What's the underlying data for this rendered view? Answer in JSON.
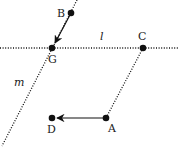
{
  "diagram": {
    "colors": {
      "ink": "#111111",
      "dots": "#111111",
      "background": "#ffffff"
    },
    "points": [
      {
        "id": "B",
        "label": "B",
        "x": 71,
        "y": 13,
        "lx": 57,
        "ly": 17
      },
      {
        "id": "G",
        "label": "G",
        "x": 52,
        "y": 48,
        "lx": 48,
        "ly": 63
      },
      {
        "id": "C",
        "label": "C",
        "x": 143,
        "y": 48,
        "lx": 138,
        "ly": 40
      },
      {
        "id": "D",
        "label": "D",
        "x": 52,
        "y": 118,
        "lx": 47,
        "ly": 133
      },
      {
        "id": "A",
        "label": "A",
        "x": 106,
        "y": 118,
        "lx": 108,
        "ly": 132
      }
    ],
    "lines": [
      {
        "id": "l",
        "label": "l",
        "style": "dotted",
        "x1": 0,
        "y1": 48,
        "x2": 179,
        "y2": 48,
        "lx": 100,
        "ly": 40
      },
      {
        "id": "m",
        "label": "m",
        "style": "dotted",
        "x1": 77,
        "y1": 0,
        "x2": 2,
        "y2": 146,
        "lx": 14,
        "ly": 86
      },
      {
        "id": "CA",
        "label": "",
        "style": "dotted",
        "x1": 143,
        "y1": 48,
        "x2": 106,
        "y2": 118
      }
    ],
    "vectors": [
      {
        "id": "BG",
        "from": "B",
        "to": "G",
        "x1": 71,
        "y1": 13,
        "x2": 55,
        "y2": 43
      },
      {
        "id": "AD",
        "from": "A",
        "to": "D",
        "x1": 106,
        "y1": 118,
        "x2": 57,
        "y2": 118
      }
    ]
  }
}
